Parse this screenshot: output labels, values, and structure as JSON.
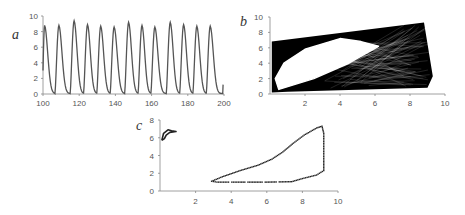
{
  "chart_data": [
    {
      "id": "a",
      "panel_label": "a",
      "type": "line",
      "title": "",
      "xlabel": "",
      "ylabel": "",
      "xlim": [
        100,
        200
      ],
      "ylim": [
        0,
        10
      ],
      "xticks": [
        "100",
        "120",
        "140",
        "160",
        "180",
        "200"
      ],
      "yticks": [
        "0",
        "2",
        "4",
        "6",
        "8",
        "10"
      ],
      "grid": false,
      "line_color": "#555555",
      "description": "periodic spiking time series",
      "peaks": [
        {
          "t": 100.9,
          "v": 8.8
        },
        {
          "t": 108.8,
          "v": 8.8
        },
        {
          "t": 117.2,
          "v": 9.4
        },
        {
          "t": 124.6,
          "v": 8.9
        },
        {
          "t": 131.9,
          "v": 8.7
        },
        {
          "t": 139.3,
          "v": 8.6
        },
        {
          "t": 147.3,
          "v": 9.2
        },
        {
          "t": 154.7,
          "v": 8.8
        },
        {
          "t": 161.8,
          "v": 8.6
        },
        {
          "t": 170.3,
          "v": 9.2
        },
        {
          "t": 177.7,
          "v": 8.9
        },
        {
          "t": 185.0,
          "v": 8.7
        },
        {
          "t": 192.4,
          "v": 8.7
        }
      ],
      "baseline": 0.05,
      "end_value": 1.2
    },
    {
      "id": "b",
      "panel_label": "b",
      "type": "line",
      "title": "",
      "xlabel": "",
      "ylabel": "",
      "xlim": [
        0,
        10
      ],
      "ylim": [
        0,
        10
      ],
      "xticks": [
        "2",
        "4",
        "6",
        "8",
        "10"
      ],
      "yticks": [
        "0",
        "2",
        "4",
        "6",
        "8",
        "10"
      ],
      "grid": false,
      "line_color": "#000000",
      "description": "dense chaotic phase-space trajectory with hollow elliptical region",
      "outer_boundary": [
        [
          0.1,
          0.2
        ],
        [
          0.1,
          6.8
        ],
        [
          8.8,
          9.3
        ],
        [
          9.3,
          2.3
        ],
        [
          9.0,
          0.8
        ],
        [
          1.0,
          0.3
        ],
        [
          0.1,
          0.2
        ]
      ],
      "hole": [
        [
          0.5,
          0.6
        ],
        [
          0.3,
          2.0
        ],
        [
          0.8,
          4.0
        ],
        [
          2.0,
          5.8
        ],
        [
          4.0,
          7.2
        ],
        [
          5.2,
          6.8
        ],
        [
          6.2,
          6.2
        ],
        [
          4.5,
          4.0
        ],
        [
          2.5,
          2.0
        ],
        [
          0.5,
          0.6
        ]
      ]
    },
    {
      "id": "c",
      "panel_label": "c",
      "type": "scatter",
      "title": "",
      "xlabel": "",
      "ylabel": "",
      "xlim": [
        0,
        10
      ],
      "ylim": [
        0,
        8
      ],
      "xticks": [
        "2",
        "4",
        "6",
        "8",
        "10"
      ],
      "yticks": [
        "0",
        "2",
        "4",
        "6",
        "8"
      ],
      "grid": false,
      "marker_color": "#222222",
      "small_loop": [
        [
          0.1,
          5.7
        ],
        [
          0.2,
          6.5
        ],
        [
          0.45,
          6.9
        ],
        [
          0.65,
          6.8
        ],
        [
          0.9,
          6.7
        ],
        [
          0.55,
          6.6
        ],
        [
          0.35,
          6.3
        ],
        [
          0.25,
          5.9
        ],
        [
          0.1,
          5.7
        ]
      ],
      "large_loop": [
        [
          2.9,
          1.1
        ],
        [
          3.5,
          1.6
        ],
        [
          4.5,
          2.3
        ],
        [
          5.5,
          2.9
        ],
        [
          6.3,
          3.6
        ],
        [
          6.9,
          4.4
        ],
        [
          7.5,
          5.4
        ],
        [
          8.1,
          6.3
        ],
        [
          8.8,
          7.1
        ],
        [
          9.1,
          7.3
        ],
        [
          9.2,
          6.5
        ],
        [
          9.2,
          5.0
        ],
        [
          9.2,
          3.5
        ],
        [
          9.2,
          2.3
        ],
        [
          8.8,
          1.8
        ],
        [
          8.0,
          1.4
        ],
        [
          7.4,
          1.05
        ],
        [
          6.0,
          1.0
        ],
        [
          4.5,
          1.0
        ],
        [
          3.2,
          1.0
        ],
        [
          2.9,
          1.1
        ]
      ]
    }
  ]
}
